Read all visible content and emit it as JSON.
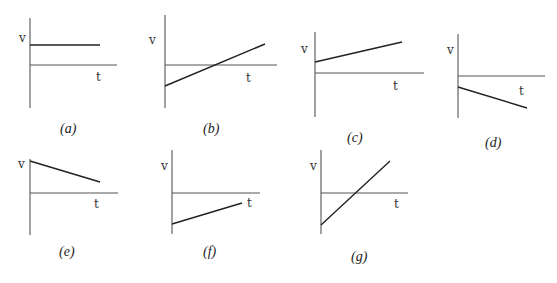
{
  "figure": {
    "panels": [
      {
        "id": "a",
        "caption": "(a)",
        "y_label": "v",
        "x_label": "t",
        "description": "constant positive velocity",
        "axis": {
          "x0": 30,
          "y_top": 18,
          "y_bottom": 108,
          "y_zero": 65,
          "x_end": 117
        },
        "line": {
          "x1": 30,
          "y1": 45,
          "x2": 100,
          "y2": 45
        },
        "v_pos": [
          19,
          42
        ],
        "t_pos": [
          96,
          81
        ],
        "cap_pos": [
          60,
          133
        ]
      },
      {
        "id": "b",
        "caption": "(b)",
        "y_label": "v",
        "x_label": "t",
        "description": "negative initial velocity increasing linearly, crossing zero",
        "axis": {
          "x0": 165,
          "y_top": 15,
          "y_bottom": 108,
          "y_zero": 65,
          "x_end": 277
        },
        "line": {
          "x1": 165,
          "y1": 86,
          "x2": 265,
          "y2": 44
        },
        "v_pos": [
          149,
          44
        ],
        "t_pos": [
          246,
          82
        ],
        "cap_pos": [
          203,
          133
        ]
      },
      {
        "id": "c",
        "caption": "(c)",
        "y_label": "v",
        "x_label": "t",
        "description": "positive initial velocity increasing linearly",
        "axis": {
          "x0": 315,
          "y_top": 32,
          "y_bottom": 117,
          "y_zero": 73,
          "x_end": 424
        },
        "line": {
          "x1": 315,
          "y1": 62,
          "x2": 402,
          "y2": 42
        },
        "v_pos": [
          301,
          53
        ],
        "t_pos": [
          393,
          90
        ],
        "cap_pos": [
          347,
          142
        ]
      },
      {
        "id": "d",
        "caption": "(d)",
        "y_label": "v",
        "x_label": "t",
        "description": "negative initial velocity decreasing linearly",
        "axis": {
          "x0": 458,
          "y_top": 34,
          "y_bottom": 118,
          "y_zero": 76,
          "x_end": 545
        },
        "line": {
          "x1": 458,
          "y1": 87,
          "x2": 527,
          "y2": 108
        },
        "v_pos": [
          447,
          54
        ],
        "t_pos": [
          519,
          95
        ],
        "cap_pos": [
          485,
          147
        ]
      },
      {
        "id": "e",
        "caption": "(e)",
        "y_label": "v",
        "x_label": "t",
        "description": "positive initial velocity decreasing linearly",
        "axis": {
          "x0": 30,
          "y_top": 159,
          "y_bottom": 235,
          "y_zero": 193,
          "x_end": 118
        },
        "line": {
          "x1": 30,
          "y1": 161,
          "x2": 100,
          "y2": 182
        },
        "v_pos": [
          18,
          168
        ],
        "t_pos": [
          94,
          208
        ],
        "cap_pos": [
          59,
          256
        ]
      },
      {
        "id": "f",
        "caption": "(f)",
        "y_label": "v",
        "x_label": "t",
        "description": "negative initial velocity increasing linearly, remaining negative",
        "axis": {
          "x0": 172,
          "y_top": 150,
          "y_bottom": 234,
          "y_zero": 193,
          "x_end": 260
        },
        "line": {
          "x1": 172,
          "y1": 224,
          "x2": 242,
          "y2": 203
        },
        "v_pos": [
          161,
          170
        ],
        "t_pos": [
          247,
          207
        ],
        "cap_pos": [
          203,
          256
        ]
      },
      {
        "id": "g",
        "caption": "(g)",
        "y_label": "v",
        "x_label": "t",
        "description": "negative initial velocity increasing steeply, crossing zero",
        "axis": {
          "x0": 321,
          "y_top": 150,
          "y_bottom": 234,
          "y_zero": 193,
          "x_end": 408
        },
        "line": {
          "x1": 321,
          "y1": 225,
          "x2": 390,
          "y2": 161
        },
        "v_pos": [
          310,
          170
        ],
        "t_pos": [
          394,
          208
        ],
        "cap_pos": [
          351,
          261
        ]
      }
    ]
  }
}
